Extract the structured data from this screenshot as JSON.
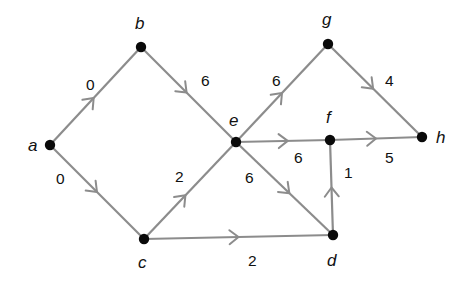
{
  "diagram": {
    "type": "weighted-directed-graph",
    "colors": {
      "edge": "#8c8c8c",
      "node": "#0a0a0a",
      "text": "#111111"
    },
    "nodes": [
      {
        "id": "a",
        "label": "a",
        "x": 50,
        "y": 145,
        "lx": 28,
        "ly": 151
      },
      {
        "id": "b",
        "label": "b",
        "x": 141,
        "y": 47,
        "lx": 135,
        "ly": 29
      },
      {
        "id": "c",
        "label": "c",
        "x": 144,
        "y": 239,
        "lx": 138,
        "ly": 268
      },
      {
        "id": "e",
        "label": "e",
        "x": 236,
        "y": 142,
        "lx": 229,
        "ly": 126
      },
      {
        "id": "g",
        "label": "g",
        "x": 328,
        "y": 44,
        "lx": 322,
        "ly": 25
      },
      {
        "id": "f",
        "label": "f",
        "x": 330,
        "y": 140,
        "lx": 326,
        "ly": 123
      },
      {
        "id": "h",
        "label": "h",
        "x": 422,
        "y": 137,
        "lx": 436,
        "ly": 143
      },
      {
        "id": "d",
        "label": "d",
        "x": 333,
        "y": 235,
        "lx": 327,
        "ly": 266
      }
    ],
    "edges": [
      {
        "from": "a",
        "to": "b",
        "weight": "0",
        "t": 0.48,
        "wx": 86,
        "wy": 90
      },
      {
        "from": "a",
        "to": "c",
        "weight": "0",
        "t": 0.5,
        "wx": 56,
        "wy": 184
      },
      {
        "from": "b",
        "to": "e",
        "weight": "6",
        "t": 0.48,
        "wx": 201,
        "wy": 86
      },
      {
        "from": "c",
        "to": "e",
        "weight": "2",
        "t": 0.45,
        "wx": 175,
        "wy": 182
      },
      {
        "from": "c",
        "to": "d",
        "weight": "2",
        "t": 0.5,
        "wx": 248,
        "wy": 266
      },
      {
        "from": "e",
        "to": "g",
        "weight": "6",
        "t": 0.5,
        "wx": 272,
        "wy": 86
      },
      {
        "from": "e",
        "to": "f",
        "weight": "6",
        "t": 0.55,
        "wx": 294,
        "wy": 163
      },
      {
        "from": "e",
        "to": "d",
        "weight": "6",
        "t": 0.55,
        "wx": 245,
        "wy": 183
      },
      {
        "from": "d",
        "to": "f",
        "weight": "1",
        "t": 0.5,
        "wx": 344,
        "wy": 178
      },
      {
        "from": "f",
        "to": "h",
        "weight": "5",
        "t": 0.5,
        "wx": 385,
        "wy": 163
      },
      {
        "from": "g",
        "to": "h",
        "weight": "4",
        "t": 0.48,
        "wx": 385,
        "wy": 86
      }
    ]
  }
}
